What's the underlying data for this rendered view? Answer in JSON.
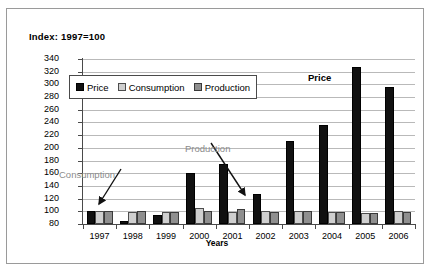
{
  "chart_data": {
    "type": "bar",
    "title": "Index: 1997=100",
    "xlabel": "Years",
    "ylabel": "",
    "ylim": [
      80,
      340
    ],
    "ytick_step": 20,
    "yticks": [
      340,
      320,
      300,
      280,
      260,
      240,
      220,
      200,
      180,
      160,
      140,
      120,
      100,
      80
    ],
    "grid": true,
    "legend_position": "top-left-inside",
    "categories": [
      "1997",
      "1998",
      "1999",
      "2000",
      "2001",
      "2002",
      "2003",
      "2004",
      "2005",
      "2006"
    ],
    "series": [
      {
        "name": "Price",
        "color": "#111111",
        "values": [
          100,
          85,
          94,
          160,
          174,
          127,
          211,
          236,
          327,
          296
        ]
      },
      {
        "name": "Consumption",
        "color": "#cfcfcf",
        "values": [
          100,
          99,
          99,
          105,
          99,
          101,
          100,
          99,
          98,
          100
        ]
      },
      {
        "name": "Production",
        "color": "#8f8f8f",
        "values": [
          100,
          100,
          99,
          101,
          104,
          99,
          101,
          99,
          97,
          99
        ]
      }
    ],
    "annotations": [
      {
        "text": "Consumption",
        "target_series": "Consumption",
        "target_category": "1997",
        "color": "#8c8c8c"
      },
      {
        "text": "Production",
        "target_series": "Production",
        "target_category": "2002",
        "color": "#8c8c8c"
      },
      {
        "text": "Price",
        "target_series": "Price",
        "target_category": "2005",
        "color": "#000000"
      }
    ]
  },
  "legend": {
    "items": [
      {
        "label": "Price"
      },
      {
        "label": "Consumption"
      },
      {
        "label": "Production"
      }
    ]
  }
}
